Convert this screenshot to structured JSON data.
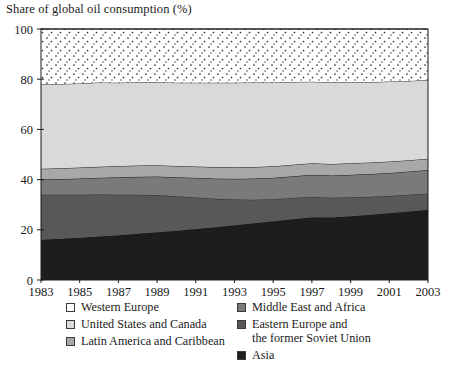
{
  "chart_data": {
    "type": "area",
    "title": "Share of global oil consumption (%)",
    "xlabel": "",
    "ylabel": "",
    "stacked": true,
    "percent_stacked": true,
    "grid": false,
    "legend_position": "bottom",
    "x": [
      1983,
      1984,
      1985,
      1986,
      1987,
      1988,
      1989,
      1990,
      1991,
      1992,
      1993,
      1994,
      1995,
      1996,
      1997,
      1998,
      1999,
      2000,
      2001,
      2002,
      2003
    ],
    "xlim": [
      1983,
      2003
    ],
    "ylim": [
      0,
      100
    ],
    "xticks": [
      1983,
      1985,
      1987,
      1989,
      1991,
      1993,
      1995,
      1997,
      1999,
      2001,
      2003
    ],
    "yticks": [
      0,
      20,
      40,
      60,
      80,
      100
    ],
    "series": [
      {
        "name": "Asia",
        "color": "#1d1d1d",
        "values": [
          16.0,
          16.4,
          16.8,
          17.3,
          17.8,
          18.4,
          19.0,
          19.6,
          20.3,
          21.0,
          21.8,
          22.6,
          23.4,
          24.2,
          25.0,
          24.9,
          25.4,
          26.0,
          26.6,
          27.3,
          28.0
        ]
      },
      {
        "name": "Eastern Europe and\nthe former Soviet Union",
        "color": "#585858",
        "values": [
          18.0,
          17.6,
          17.2,
          16.8,
          16.2,
          15.6,
          14.9,
          13.8,
          12.6,
          11.4,
          10.3,
          9.4,
          8.8,
          8.5,
          8.2,
          7.9,
          7.6,
          7.2,
          6.9,
          6.7,
          6.5
        ]
      },
      {
        "name": "Middle East and Africa",
        "color": "#7a7a7a",
        "values": [
          6.0,
          6.2,
          6.4,
          6.6,
          6.9,
          7.1,
          7.3,
          7.5,
          7.8,
          8.0,
          8.2,
          8.4,
          8.5,
          8.6,
          8.7,
          8.8,
          8.9,
          9.0,
          9.1,
          9.2,
          9.3
        ]
      },
      {
        "name": "Latin America and Caribbean",
        "color": "#a8a8a8",
        "values": [
          4.3,
          4.3,
          4.4,
          4.4,
          4.5,
          4.5,
          4.5,
          4.5,
          4.5,
          4.6,
          4.6,
          4.6,
          4.6,
          4.6,
          4.6,
          4.6,
          4.6,
          4.6,
          4.6,
          4.5,
          4.5
        ]
      },
      {
        "name": "United States and Canada",
        "color": "#d9d9d9",
        "values": [
          33.7,
          33.6,
          33.5,
          33.6,
          33.2,
          33.2,
          33.1,
          33.2,
          33.4,
          33.6,
          33.7,
          33.7,
          33.4,
          33.0,
          32.5,
          32.6,
          32.3,
          32.0,
          31.9,
          31.6,
          31.4
        ]
      },
      {
        "name": "Western Europe",
        "color": "#ffffff",
        "pattern": "dots",
        "values": [
          22.0,
          21.9,
          21.7,
          21.3,
          21.4,
          21.2,
          21.2,
          21.4,
          21.4,
          21.4,
          21.4,
          21.3,
          21.3,
          21.1,
          21.0,
          21.2,
          21.2,
          21.2,
          20.9,
          20.7,
          20.3
        ]
      }
    ]
  },
  "legend": {
    "left_column": [
      {
        "label": "Western Europe",
        "swatch": "western-europe"
      },
      {
        "label": "United States and Canada",
        "swatch": "united-states-and-canada"
      },
      {
        "label": "Latin America and Caribbean",
        "swatch": "latin-america-and-caribbean"
      }
    ],
    "right_column": [
      {
        "label": "Middle East and Africa",
        "swatch": "middle-east-and-africa"
      },
      {
        "label": "Eastern Europe and\nthe former Soviet Union",
        "swatch": "eastern-europe-and-former-soviet-union"
      },
      {
        "label": "Asia",
        "swatch": "asia"
      }
    ]
  },
  "colors": {
    "western_europe": "#ffffff",
    "united_states_and_canada": "#d9d9d9",
    "latin_america_and_caribbean": "#a8a8a8",
    "middle_east_and_africa": "#7a7a7a",
    "eastern_europe_and_fsu": "#585858",
    "asia": "#1d1d1d",
    "axis": "#1a1a1a",
    "background": "#ffffff"
  }
}
